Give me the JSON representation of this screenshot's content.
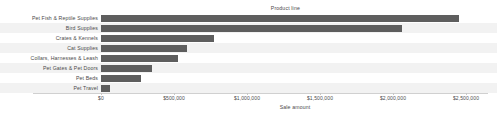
{
  "chart_data": {
    "type": "bar",
    "orientation": "horizontal",
    "title": "",
    "ylabel": "Product line",
    "xlabel": "Sale amount",
    "categories": [
      "Pet Fish & Reptile Supplies",
      "Bird Supplies",
      "Crates & Kennels",
      "Cat Supplies",
      "Collars, Harnesses & Leash",
      "Pet Gates & Pet Doors",
      "Pet Beds",
      "Pet Travel"
    ],
    "values": [
      2450000,
      2060000,
      775000,
      590000,
      530000,
      350000,
      275000,
      62000
    ],
    "xlim": [
      0,
      2650000
    ],
    "xticks": [
      0,
      500000,
      1000000,
      1500000,
      2000000,
      2500000
    ],
    "xtick_labels": [
      "$0",
      "$500,000",
      "$1,000,000",
      "$1,500,000",
      "$2,000,000",
      "$2,500,000"
    ],
    "grid": false,
    "legend": null,
    "bar_color": "#5e5e5e",
    "row_band_color": "#f2f2f2",
    "axis_color": "#d0d0d0",
    "text_color": "#4a4a4a"
  }
}
